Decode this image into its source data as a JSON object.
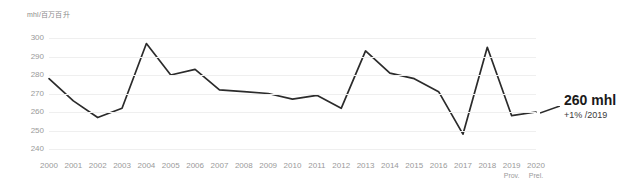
{
  "axis": {
    "unit_label": "mhl/百万百升",
    "y_ticks": [
      300,
      290,
      280,
      270,
      260,
      250,
      240
    ],
    "y_min": 240,
    "y_max": 300
  },
  "callout": {
    "value": "260 mhl",
    "delta": "+1% /2019"
  },
  "chart_data": {
    "type": "line",
    "title": "",
    "xlabel": "",
    "ylabel": "mhl/百万百升",
    "ylim": [
      240,
      300
    ],
    "grid": true,
    "legend": "none",
    "categories": [
      "2000",
      "2001",
      "2002",
      "2003",
      "2004",
      "2005",
      "2006",
      "2007",
      "2008",
      "2009",
      "2010",
      "2011",
      "2012",
      "2013",
      "2014",
      "2015",
      "2016",
      "2017",
      "2018",
      "2019",
      "2020"
    ],
    "category_sublabels": [
      "",
      "",
      "",
      "",
      "",
      "",
      "",
      "",
      "",
      "",
      "",
      "",
      "",
      "",
      "",
      "",
      "",
      "",
      "",
      "Prov.",
      "Prel."
    ],
    "series": [
      {
        "name": "Production",
        "values": [
          278,
          266,
          257,
          262,
          297,
          280,
          283,
          272,
          271,
          270,
          267,
          269,
          262,
          293,
          281,
          278,
          271,
          248,
          295,
          258,
          260
        ]
      }
    ],
    "annotations": [
      {
        "x": "2020",
        "y": 260,
        "text": "260 mhl",
        "subtext": "+1% /2019"
      }
    ]
  },
  "colors": {
    "line": "#2b2b2b",
    "grid": "#efefef",
    "tick_text": "#9a9a9a",
    "callout_text": "#1a1a1a"
  }
}
